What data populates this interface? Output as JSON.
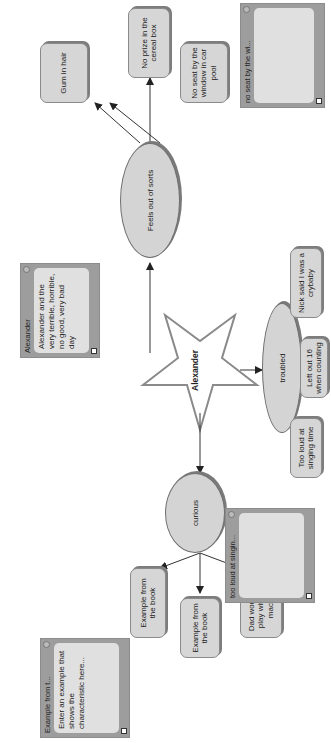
{
  "diagram": {
    "orientation": "rotated 90° counter-clockwise",
    "center": {
      "label": "Alexander",
      "shape": "star"
    },
    "branches": [
      {
        "label": "Feels out of sorts",
        "shape": "oval",
        "children": [
          "Gum in hair",
          "No prize in the cereal box",
          "No seat by the window in car pool"
        ]
      },
      {
        "label": "troubled",
        "shape": "oval",
        "children": [
          "Nick said I was a crybaby",
          "Left out 16 when counting",
          "Too loud at singing time"
        ]
      },
      {
        "label": "curious",
        "shape": "oval",
        "children": [
          "Dad wouldn't let play with copy machine",
          "Example from the book",
          "Example from the book"
        ]
      }
    ],
    "notes": [
      {
        "title": "Alexander",
        "body": "Alexander and the very terrible, horrible, no good, very bad day"
      },
      {
        "title": "no seat by the wi...",
        "body": ""
      },
      {
        "title": "too loud at singin...",
        "body": ""
      },
      {
        "title": "Example from t...",
        "body": "Enter an example that shows the characteristic here..."
      }
    ]
  },
  "colors": {
    "node_fill": "#d6d6d6",
    "note_frame": "#9d9d9d",
    "line": "#333333"
  }
}
